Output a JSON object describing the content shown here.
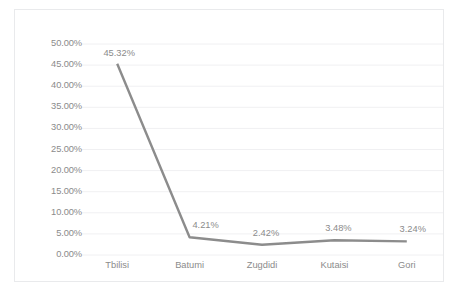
{
  "chart_data": {
    "type": "line",
    "title": "",
    "subtitle": "",
    "xlabel": "",
    "ylabel": "",
    "categories": [
      "Tbilisi",
      "Batumi",
      "Zugdidi",
      "Kutaisi",
      "Gori"
    ],
    "values": [
      45.32,
      4.21,
      2.42,
      3.48,
      3.24
    ],
    "data_labels": [
      "45.32%",
      "4.21%",
      "2.42%",
      "3.48%",
      "3.24%"
    ],
    "series": [
      {
        "name": "",
        "values": [
          45.32,
          4.21,
          2.42,
          3.48,
          3.24
        ]
      }
    ],
    "ylim": [
      0,
      50
    ],
    "yticks": [
      0,
      5,
      10,
      15,
      20,
      25,
      30,
      35,
      40,
      45,
      50
    ],
    "ytick_labels": [
      "0.00%",
      "5.00%",
      "10.00%",
      "15.00%",
      "20.00%",
      "25.00%",
      "30.00%",
      "35.00%",
      "40.00%",
      "45.00%",
      "50.00%"
    ],
    "grid": true,
    "grid_axis": "y",
    "legend": false,
    "legend_position": "none",
    "markers": false,
    "line_color": "#8c8c8c",
    "grid_color": "#f0f0f2",
    "border_color": "#e9eaec",
    "label_color": "#8b8b8b",
    "background": "#ffffff"
  },
  "caption": {
    "text": ""
  }
}
